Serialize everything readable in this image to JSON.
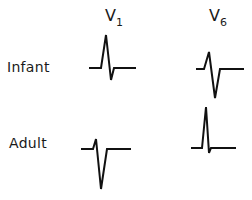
{
  "columns": [
    {
      "id": "v1",
      "lead": "V",
      "subscript": "1"
    },
    {
      "id": "v6",
      "lead": "V",
      "subscript": "6"
    }
  ],
  "rows": [
    {
      "id": "infant",
      "label": "Infant"
    },
    {
      "id": "adult",
      "label": "Adult"
    }
  ],
  "waveforms": {
    "infant_v1": {
      "description": "Tall R wave, small S wave",
      "points": "89,68 101,68 106,35 111,80 114,68 136,68"
    },
    "infant_v6": {
      "description": "Small R wave, deep S wave",
      "points": "196,69 204,69 209,52 215,98 220,69 244,69"
    },
    "adult_v1": {
      "description": "Small r wave, deep S wave",
      "points": "81,149 93,149 96,139 101,189 107,149 131,149"
    },
    "adult_v6": {
      "description": "Tall R wave, small s wave",
      "points": "191,148 202,148 206,107 209,153 211,148 236,148"
    }
  },
  "colors": {
    "trace": "#111111",
    "text": "#1a1a1a",
    "background": "#ffffff"
  }
}
